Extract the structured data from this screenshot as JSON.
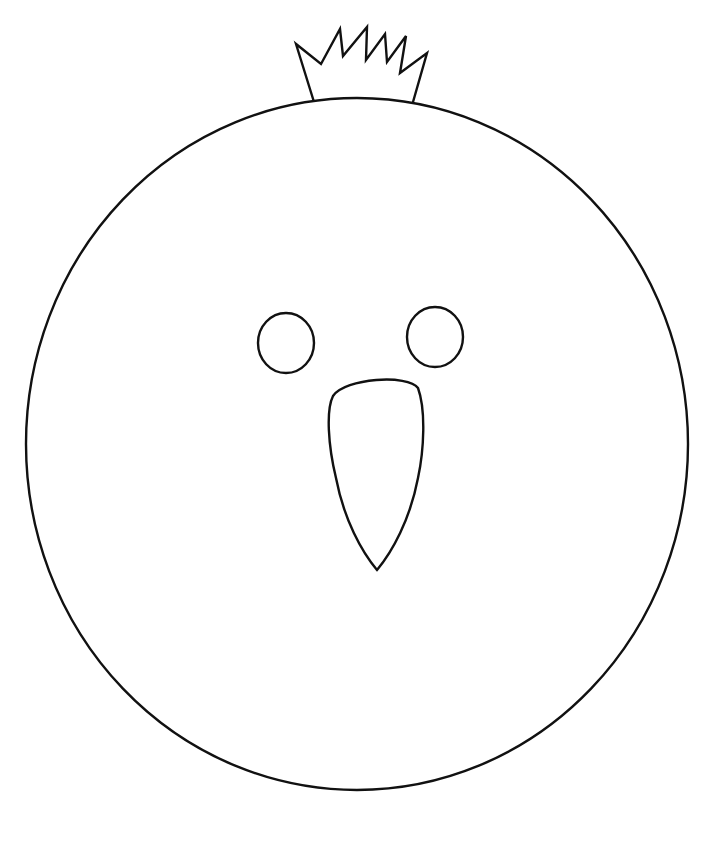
{
  "image": {
    "title": "Coloring page: bird face with crown",
    "subject": "round bird/chick face outline",
    "stroke_color": "#111111",
    "background_color": "#ffffff"
  },
  "shapes": {
    "head": {
      "cx": 357,
      "cy": 444,
      "rx": 331,
      "ry": 346
    },
    "left_eye": {
      "cx": 286,
      "cy": 343,
      "rx": 28,
      "ry": 30
    },
    "right_eye": {
      "cx": 435,
      "cy": 337,
      "rx": 28,
      "ry": 30
    },
    "beak": {
      "top_y": 378,
      "left_x": 329,
      "right_x": 421,
      "tip": [
        377,
        570
      ]
    },
    "crown": {
      "points": "314,102 296,44 321,64 340,29 343,56 367,27 366,60 385,34 387,62 406,36 400,73 427,53 413,102"
    }
  },
  "top_text": ""
}
